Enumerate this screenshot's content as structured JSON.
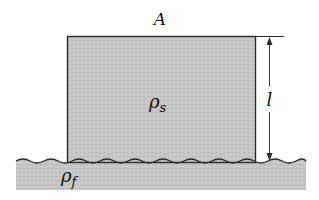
{
  "diagram": {
    "labels": {
      "area": "A",
      "solid_density": "ρ",
      "solid_density_sub": "s",
      "fluid_density": "ρ",
      "fluid_density_sub": "f",
      "length": "l"
    },
    "colors": {
      "block_fill": "#c4c4c4",
      "fluid_fill": "#c8c8c8",
      "stroke": "#2a2a2a",
      "background": "#ffffff"
    }
  }
}
